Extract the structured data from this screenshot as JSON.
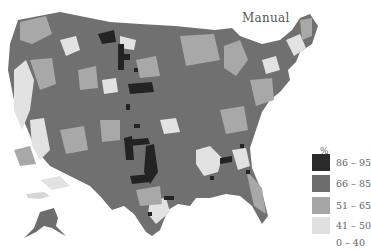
{
  "map": {
    "title": "Manual",
    "region": "United States counties (contiguous US + Alaska)",
    "type": "choropleth",
    "legend": {
      "unit": "%",
      "bins": [
        {
          "label": "86 – 95",
          "color": "#2b2b2b"
        },
        {
          "label": "66 – 85",
          "color": "#6d6d6d"
        },
        {
          "label": "51 – 65",
          "color": "#a6a6a6"
        },
        {
          "label": "41 – 50",
          "color": "#e0e0e0"
        },
        {
          "label": "0 – 40",
          "color": "#ffffff"
        }
      ]
    }
  }
}
